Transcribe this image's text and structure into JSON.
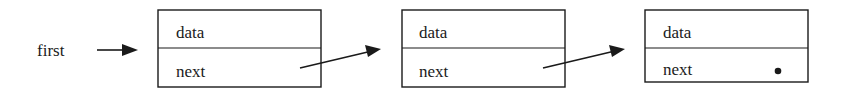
{
  "diagram": {
    "pointer_label": "first",
    "nodes": [
      {
        "data_label": "data",
        "next_label": "next",
        "next_is_null": false
      },
      {
        "data_label": "data",
        "next_label": "next",
        "next_is_null": false
      },
      {
        "data_label": "data",
        "next_label": "next",
        "next_is_null": true
      }
    ],
    "null_marker": "•",
    "colors": {
      "stroke": "#1a1a1a",
      "background": "#ffffff"
    }
  }
}
